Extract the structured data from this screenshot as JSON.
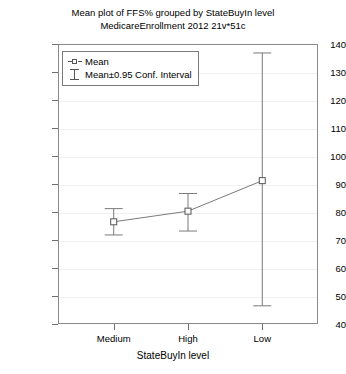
{
  "chart_data": {
    "type": "line",
    "title": "Mean plot of FFS% grouped by StateBuyIn level",
    "subtitle": "MedicareEnrollment 2012 21v*51c",
    "xlabel": "StateBuyIn level",
    "ylabel": "FFS%",
    "categories": [
      "Medium",
      "High",
      "Low"
    ],
    "values": [
      76.5,
      80.3,
      91.2
    ],
    "error_low": [
      71.8,
      73.2,
      46.5
    ],
    "error_high": [
      81.2,
      86.6,
      136.8
    ],
    "ylim": [
      40,
      140
    ],
    "yticks": [
      40,
      50,
      60,
      70,
      80,
      90,
      100,
      110,
      120,
      130,
      140
    ],
    "grid": true,
    "legend_position": "top-left",
    "legend": [
      {
        "label": "Mean",
        "marker": "open-square"
      },
      {
        "label": "Mean±0.95 Conf. Interval",
        "marker": "error-bar"
      }
    ],
    "series": [
      {
        "name": "Mean",
        "points": [
          {
            "category": "Medium",
            "mean": 76.5,
            "ci_low": 71.8,
            "ci_high": 81.2
          },
          {
            "category": "High",
            "mean": 80.3,
            "ci_low": 73.2,
            "ci_high": 86.6
          },
          {
            "category": "Low",
            "mean": 91.2,
            "ci_low": 46.5,
            "ci_high": 136.8
          }
        ]
      }
    ]
  },
  "colors": {
    "line": "#7a7a7a",
    "marker_edge": "#555555",
    "axis": "#8a8a8a",
    "grid": "#f0f0f0",
    "text": "#000000"
  }
}
